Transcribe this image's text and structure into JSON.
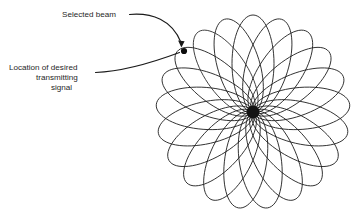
{
  "figure": {
    "background_color": "#ffffff",
    "line_color": "#1c1c1c",
    "selected_beam_fill": "#919191",
    "selected_beam_stroke": "#2b2b2b",
    "hub_color": "#141414",
    "dot_color": "#0d0d0d"
  },
  "labels": {
    "selected_beam": {
      "text": "Selected beam",
      "x": 62,
      "y": 17
    },
    "location_line1": {
      "text": "Location of desired",
      "x": 9,
      "y": 70
    },
    "location_line2": {
      "text": "transmitting",
      "x": 36,
      "y": 80
    },
    "location_line3": {
      "text": "signal",
      "x": 51,
      "y": 90
    }
  },
  "chart_data": {
    "type": "scatter",
    "xlabel": "",
    "ylabel": "",
    "center_x": 253,
    "center_y": 112,
    "beam_count": 21,
    "beam_length": 97,
    "beam_half_width": 21,
    "selected_beam_index": 7,
    "selected_beam_angle_deg": 120,
    "target_dot_x": 184,
    "target_dot_y": 51,
    "target_dot_radius": 3.1,
    "hub_radius": 6.5,
    "annotations": [
      "Selected beam",
      "Location of desired transmitting signal"
    ]
  }
}
